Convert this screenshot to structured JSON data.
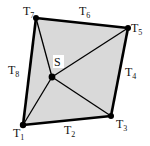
{
  "diagram": {
    "fill_color": "#d9d9d9",
    "stroke_color": "#000000",
    "vertices": {
      "T1": {
        "x": 23,
        "y": 125
      },
      "T3": {
        "x": 111,
        "y": 116
      },
      "T5": {
        "x": 128,
        "y": 28
      },
      "T7": {
        "x": 36,
        "y": 18
      },
      "S": {
        "x": 52,
        "y": 77
      }
    },
    "labels": {
      "T1": {
        "base": "T",
        "sub": "1"
      },
      "T2": {
        "base": "T",
        "sub": "2"
      },
      "T3": {
        "base": "T",
        "sub": "3"
      },
      "T4": {
        "base": "T",
        "sub": "4"
      },
      "T5": {
        "base": "T",
        "sub": "5"
      },
      "T6": {
        "base": "T",
        "sub": "6"
      },
      "T7": {
        "base": "T",
        "sub": "7"
      },
      "T8": {
        "base": "T",
        "sub": "8"
      },
      "S": "S"
    }
  }
}
